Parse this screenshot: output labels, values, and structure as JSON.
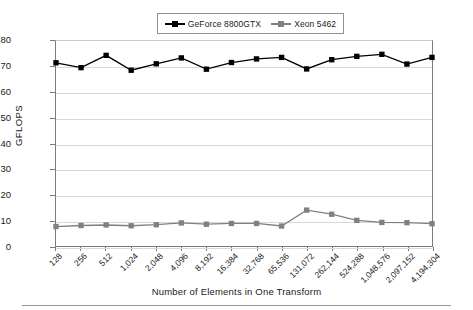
{
  "chart_data": {
    "type": "line",
    "title": "",
    "xlabel": "Number of Elements in One Transform",
    "ylabel": "GFLOPS",
    "ylim": [
      0,
      80
    ],
    "ytick_labels": [
      "0",
      "10",
      "20",
      "30",
      "40",
      "50",
      "60",
      "70",
      "80"
    ],
    "ytick_values": [
      0,
      10,
      20,
      30,
      40,
      50,
      60,
      70,
      80
    ],
    "grid": "horizontal",
    "legend_position": "top-center",
    "categories": [
      "128",
      "256",
      "512",
      "1,024",
      "2,048",
      "4,096",
      "8,192",
      "16,384",
      "32,768",
      "65,536",
      "131,072",
      "262,144",
      "524,288",
      "1,048,576",
      "2,097,152",
      "4,194,304"
    ],
    "series": [
      {
        "name": "GeForce 8800GTX",
        "color": "#000000",
        "marker": "square",
        "values": [
          71.5,
          69.6,
          74.4,
          68.6,
          71.1,
          73.4,
          69.0,
          71.6,
          73.0,
          73.6,
          69.1,
          72.7,
          74.0,
          74.8,
          71.0,
          73.6
        ]
      },
      {
        "name": "Xeon 5462",
        "color": "#808080",
        "marker": "square",
        "values": [
          7.6,
          8.0,
          8.2,
          7.9,
          8.3,
          9.0,
          8.5,
          8.8,
          8.8,
          7.8,
          14.0,
          12.4,
          10.0,
          9.2,
          9.1,
          8.7
        ]
      }
    ]
  },
  "legend": {
    "entries": [
      {
        "label": "GeForce 8800GTX"
      },
      {
        "label": "Xeon 5462"
      }
    ]
  }
}
